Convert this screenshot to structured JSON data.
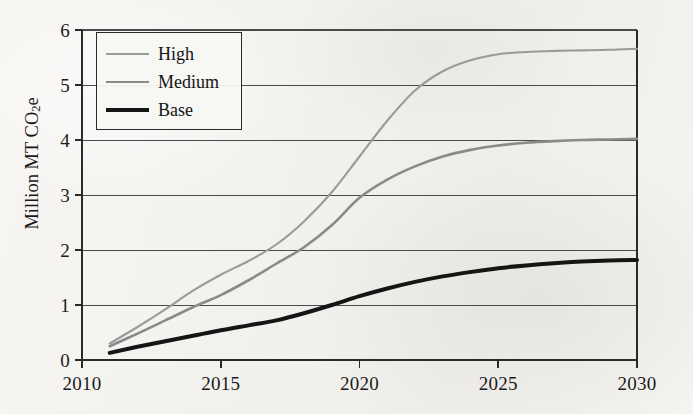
{
  "figure": {
    "background_color": "#f4f3f0",
    "axis_color": "#2a2a2a",
    "grid_color": "#4a4a4a"
  },
  "axes": {
    "y_title_text": "Million MT CO",
    "y_title_sub": "2",
    "y_title_suffix": "e",
    "y_title_full": "Million MT CO2e",
    "y_ticks": [
      "0",
      "1",
      "2",
      "3",
      "4",
      "5",
      "6"
    ],
    "x_ticks": [
      "2010",
      "2015",
      "2020",
      "2025",
      "2030"
    ]
  },
  "legend": {
    "position": "upper-left-inside",
    "entries": [
      {
        "label": "High",
        "color": "#9a9a9a",
        "width": 2.1
      },
      {
        "label": "Medium",
        "color": "#8a8a8a",
        "width": 2.6
      },
      {
        "label": "Base",
        "color": "#151515",
        "width": 4.0
      }
    ]
  },
  "chart_data": {
    "type": "line",
    "title": "",
    "xlabel": "",
    "ylabel": "Million MT CO2e",
    "xlim": [
      2010,
      2030
    ],
    "ylim": [
      0,
      6
    ],
    "ytick_values": [
      0,
      1,
      2,
      3,
      4,
      5,
      6
    ],
    "xtick_values": [
      2010,
      2015,
      2020,
      2025,
      2030
    ],
    "grid": "horizontal",
    "legend_position": "upper left",
    "x": [
      2011,
      2012,
      2013,
      2014,
      2015,
      2016,
      2017,
      2018,
      2019,
      2020,
      2021,
      2022,
      2023,
      2024,
      2025,
      2026,
      2027,
      2028,
      2029,
      2030
    ],
    "series": [
      {
        "name": "High",
        "color": "#9a9a9a",
        "values": [
          0.3,
          0.6,
          0.92,
          1.26,
          1.55,
          1.8,
          2.1,
          2.52,
          3.05,
          3.7,
          4.35,
          4.9,
          5.25,
          5.45,
          5.56,
          5.6,
          5.62,
          5.63,
          5.64,
          5.66
        ]
      },
      {
        "name": "Medium",
        "color": "#8a8a8a",
        "values": [
          0.25,
          0.48,
          0.72,
          0.96,
          1.18,
          1.45,
          1.75,
          2.05,
          2.45,
          2.95,
          3.28,
          3.52,
          3.7,
          3.82,
          3.9,
          3.95,
          3.98,
          4.0,
          4.01,
          4.02
        ]
      },
      {
        "name": "Base",
        "color": "#151515",
        "values": [
          0.13,
          0.24,
          0.34,
          0.44,
          0.54,
          0.63,
          0.72,
          0.85,
          1.0,
          1.16,
          1.3,
          1.42,
          1.52,
          1.6,
          1.67,
          1.72,
          1.76,
          1.79,
          1.81,
          1.82
        ]
      }
    ]
  }
}
